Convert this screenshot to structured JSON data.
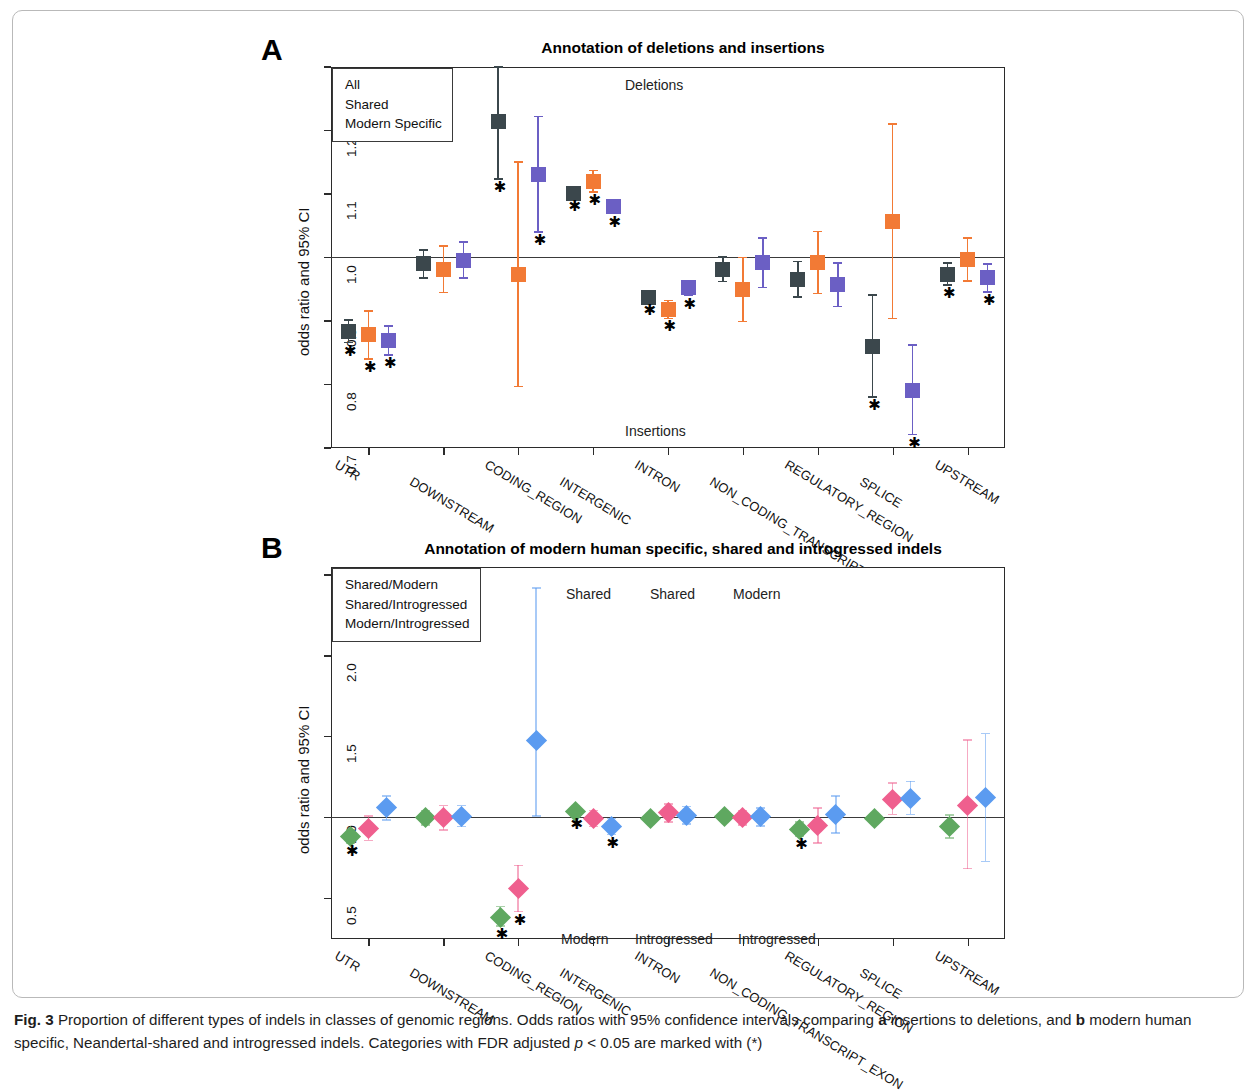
{
  "figure": {
    "caption_label": "Fig. 3",
    "caption_text_1": " Proportion of different types of indels in classes of genomic regions. Odds ratios with 95% confidence intervals comparing ",
    "caption_bold_a": "a",
    "caption_text_2": " insertions to deletions, and ",
    "caption_bold_b": "b",
    "caption_text_3": " modern human specific, Neandertal-shared and introgressed indels. Categories with FDR adjusted ",
    "caption_italic_p": "p",
    "caption_text_4": " < 0.05 are marked with (*)"
  },
  "colors": {
    "series_a_1": "#3b474c",
    "series_a_2": "#f27a35",
    "series_a_3": "#6b5fc4",
    "series_b_1": "#5fa860",
    "series_b_2": "#ef5f8e",
    "series_b_3": "#5b9bf0",
    "axis": "#2b2b2b",
    "zeroline": "#3a3a3a"
  },
  "panelA": {
    "letter": "A",
    "title": "Annotation of deletions and insertions",
    "ylabel": "odds ratio and 95% CI",
    "legend": [
      "All",
      "Shared",
      "Modern Specific"
    ],
    "note_top": "Deletions",
    "note_bottom": "Insertions",
    "ytick_labels": [
      "1.3",
      "1.2",
      "1.1",
      "1.0",
      "0.9",
      "0.8",
      "0.7"
    ]
  },
  "panelB": {
    "letter": "B",
    "title": "Annotation of modern human specific, shared and introgressed indels",
    "ylabel": "odds ratio and 95% CI",
    "legend": [
      "Shared/Modern",
      "Shared/Introgressed",
      "Modern/Introgressed"
    ],
    "notes_top": [
      "Shared",
      "Shared",
      "Modern"
    ],
    "notes_bottom": [
      "Modern",
      "Introgressed",
      "Introgressed"
    ],
    "ytick_labels": [
      "2.5",
      "2.0",
      "1.5",
      "1.0",
      "0.5"
    ]
  },
  "chart_data": [
    {
      "type": "scatter",
      "panel": "A",
      "title": "Annotation of deletions and insertions",
      "xlabel": "",
      "ylabel": "odds ratio and 95% CI",
      "ylim": [
        0.7,
        1.3
      ],
      "yticks": [
        0.7,
        0.8,
        0.9,
        1.0,
        1.1,
        1.2,
        1.3
      ],
      "reference_line": 1.0,
      "grid": false,
      "legend_position": "top-left",
      "annotations": [
        "Deletions",
        "Insertions"
      ],
      "categories": [
        "UTR",
        "DOWNSTREAM",
        "CODING_REGION",
        "INTERGENIC",
        "INTRON",
        "NON_CODING_TRANSCRIPT_EXON",
        "REGULATORY_REGION",
        "SPLICE",
        "UPSTREAM"
      ],
      "series": [
        {
          "name": "All",
          "color": "#3b474c",
          "values": [
            0.884,
            0.99,
            1.214,
            1.101,
            0.937,
            0.981,
            0.966,
            0.86,
            0.974
          ],
          "ci_low": [
            0.866,
            0.968,
            1.124,
            1.094,
            0.93,
            0.962,
            0.938,
            0.78,
            0.957
          ],
          "ci_high": [
            0.902,
            1.012,
            1.305,
            1.108,
            0.944,
            1.001,
            0.994,
            0.941,
            0.991
          ],
          "significant": [
            true,
            false,
            true,
            true,
            true,
            false,
            false,
            true,
            true
          ]
        },
        {
          "name": "Shared",
          "color": "#f27a35",
          "values": [
            0.878,
            0.981,
            0.973,
            1.12,
            0.918,
            0.949,
            0.992,
            1.056,
            0.997
          ],
          "ci_low": [
            0.84,
            0.945,
            0.797,
            1.103,
            0.904,
            0.899,
            0.943,
            0.904,
            0.963
          ],
          "ci_high": [
            0.916,
            1.018,
            1.15,
            1.137,
            0.932,
            1.0,
            1.041,
            1.21,
            1.031
          ],
          "significant": [
            true,
            false,
            false,
            true,
            true,
            false,
            false,
            false,
            false
          ]
        },
        {
          "name": "Modern Specific",
          "color": "#6b5fc4",
          "values": [
            0.869,
            0.996,
            1.13,
            1.08,
            0.952,
            0.992,
            0.957,
            0.791,
            0.968
          ],
          "ci_low": [
            0.846,
            0.968,
            1.04,
            1.069,
            0.94,
            0.953,
            0.923,
            0.721,
            0.946
          ],
          "ci_high": [
            0.892,
            1.024,
            1.222,
            1.091,
            0.964,
            1.031,
            0.991,
            0.862,
            0.99
          ],
          "significant": [
            true,
            false,
            true,
            true,
            true,
            false,
            false,
            true,
            true
          ]
        }
      ]
    },
    {
      "type": "scatter",
      "panel": "B",
      "title": "Annotation of modern human specific, shared and introgressed indels",
      "xlabel": "",
      "ylabel": "odds ratio and 95% CI",
      "ylim": [
        0.25,
        2.55
      ],
      "yticks": [
        0.5,
        1.0,
        1.5,
        2.0,
        2.5
      ],
      "reference_line": 1.0,
      "grid": false,
      "legend_position": "top-left",
      "annotations": [
        "Shared",
        "Shared",
        "Modern",
        "Modern",
        "Introgressed",
        "Introgressed"
      ],
      "categories": [
        "UTR",
        "DOWNSTREAM",
        "CODING_REGION",
        "INTERGENIC",
        "INTRON",
        "NON_CODING_TRANSCRIPT_EXON",
        "REGULATORY_REGION",
        "SPLICE",
        "UPSTREAM"
      ],
      "series": [
        {
          "name": "Shared/Modern",
          "color": "#5fa860",
          "values": [
            0.885,
            1.0,
            0.385,
            1.04,
            0.997,
            1.01,
            0.93,
            0.995,
            0.945,
            1.0
          ],
          "ci_low": [
            0.845,
            0.955,
            0.33,
            1.012,
            0.972,
            0.985,
            0.885,
            0.965,
            0.875,
            0.965
          ],
          "ci_high": [
            0.925,
            1.045,
            0.45,
            1.068,
            1.022,
            1.035,
            0.975,
            1.025,
            1.015,
            1.035
          ],
          "significant": [
            true,
            false,
            true,
            true,
            false,
            false,
            true,
            false,
            false,
            false
          ]
        },
        {
          "name": "Shared/Introgressed",
          "color": "#ef5f8e",
          "values": [
            0.935,
            1.0,
            0.56,
            0.995,
            1.03,
            1.0,
            0.95,
            1.115,
            1.075,
            1.0
          ],
          "ci_low": [
            0.86,
            0.925,
            0.42,
            0.945,
            0.975,
            0.955,
            0.845,
            1.02,
            0.685,
            0.925
          ],
          "ci_high": [
            1.01,
            1.075,
            0.705,
            1.045,
            1.085,
            1.045,
            1.06,
            1.215,
            1.48,
            1.075
          ],
          "significant": [
            false,
            false,
            true,
            false,
            false,
            false,
            false,
            false,
            false,
            false
          ]
        },
        {
          "name": "Modern/Introgressed",
          "color": "#5b9bf0",
          "values": [
            1.06,
            1.01,
            1.475,
            0.945,
            1.015,
            1.005,
            1.02,
            1.12,
            1.125,
            1.0
          ],
          "ci_low": [
            0.985,
            0.945,
            1.01,
            0.895,
            0.96,
            0.95,
            0.905,
            1.02,
            0.73,
            0.935
          ],
          "ci_high": [
            1.135,
            1.075,
            2.42,
            0.995,
            1.07,
            1.06,
            1.135,
            1.225,
            1.52,
            1.065
          ],
          "significant": [
            false,
            false,
            false,
            true,
            false,
            false,
            false,
            false,
            false,
            false
          ]
        }
      ]
    }
  ]
}
